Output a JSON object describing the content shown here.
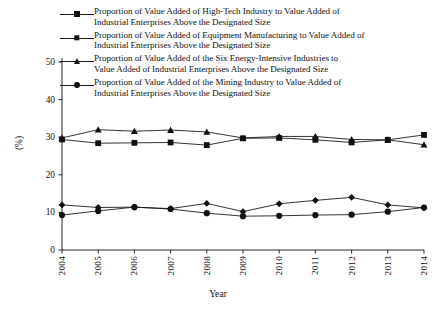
{
  "chart_data": {
    "type": "line",
    "title": "",
    "xlabel": "Year",
    "ylabel": "(%)",
    "categories": [
      "2004",
      "2005",
      "2006",
      "2007",
      "2008",
      "2009",
      "2010",
      "2011",
      "2012",
      "2013",
      "2014"
    ],
    "x": [
      2004,
      2005,
      2006,
      2007,
      2008,
      2009,
      2010,
      2011,
      2012,
      2013,
      2014
    ],
    "ylim": [
      0,
      50
    ],
    "yticks": [
      0,
      10,
      20,
      30,
      40,
      50
    ],
    "grid": false,
    "legend_position": "top",
    "series": [
      {
        "name": "Proportion of Value Added of High-Tech Industry to Value Added of Industrial Enterprises Above the Designated Size",
        "marker": "diamond",
        "values": [
          12.0,
          11.3,
          11.4,
          11.0,
          12.4,
          10.2,
          12.3,
          13.2,
          14.0,
          12.0,
          11.2
        ]
      },
      {
        "name": "Proportion of Value Added of Equipment Manufacturing to Value Added of Industrial Enterprises Above the Designated Size",
        "marker": "square",
        "values": [
          29.4,
          28.4,
          28.5,
          28.6,
          27.9,
          29.7,
          29.8,
          29.3,
          28.6,
          29.3,
          30.6
        ]
      },
      {
        "name": "Proportion of Value Added of the Six Energy-Intensive Industries to Value Added of Industrial Enterprises Above the Designated Size",
        "marker": "triangle",
        "values": [
          29.8,
          32.0,
          31.6,
          31.9,
          31.4,
          29.8,
          30.2,
          30.2,
          29.4,
          29.3,
          28.0
        ]
      },
      {
        "name": "Proportion of Value Added of the Mining Industry to Value Added of Industrial Enterprises Above the Designated Size",
        "marker": "circle",
        "values": [
          9.3,
          10.4,
          11.4,
          10.9,
          9.8,
          9.0,
          9.1,
          9.3,
          9.4,
          10.2,
          11.3
        ]
      }
    ]
  },
  "legend": {
    "entries": [
      {
        "marker": "diamond",
        "label": "Proportion of Value Added of High-Tech Industry to Value Added of\nIndustrial Enterprises Above the Designated Size"
      },
      {
        "marker": "square",
        "label": "Proportion of Value Added of Equipment Manufacturing to Value Added of\nIndustrial Enterprises Above the Designated Size"
      },
      {
        "marker": "triangle",
        "label": "Proportion of Value Added of the Six Energy-Intensive Industries to\nValue Added of Industrial Enterprises Above the Designated Size"
      },
      {
        "marker": "circle",
        "label": "Proportion of Value Added of the Mining Industry to Value Added of\nIndustrial Enterprises Above the Designated Size"
      }
    ]
  },
  "axes": {
    "y_title": "(%)",
    "x_title": "Year",
    "y_ticks": [
      "0",
      "10",
      "20",
      "30",
      "40",
      "50"
    ],
    "x_ticks": [
      "2004",
      "2005",
      "2006",
      "2007",
      "2008",
      "2009",
      "2010",
      "2011",
      "2012",
      "2013",
      "2014"
    ]
  },
  "colors": {
    "ink": "#111111",
    "background": "#ffffff"
  }
}
